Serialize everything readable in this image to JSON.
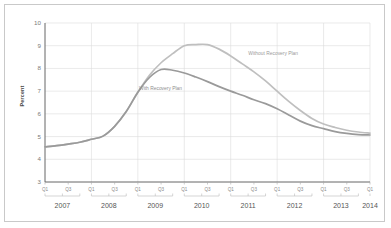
{
  "chart_data": {
    "type": "line",
    "title": "",
    "subtitle": "",
    "xlabel": "",
    "ylabel": "Percent",
    "ylim": [
      3,
      10
    ],
    "yticks": [
      3,
      4,
      5,
      6,
      7,
      8,
      9,
      10
    ],
    "grid": true,
    "legend_position": "inline-annotations",
    "x_tick_labels": [
      "Q1",
      "Q3"
    ],
    "x_groups": [
      {
        "year": "2007",
        "quarters": [
          "Q1",
          "Q3"
        ]
      },
      {
        "year": "2008",
        "quarters": [
          "Q1",
          "Q3"
        ]
      },
      {
        "year": "2009",
        "quarters": [
          "Q1",
          "Q3"
        ]
      },
      {
        "year": "2010",
        "quarters": [
          "Q1",
          "Q3"
        ]
      },
      {
        "year": "2011",
        "quarters": [
          "Q1",
          "Q3"
        ]
      },
      {
        "year": "2012",
        "quarters": [
          "Q1",
          "Q3"
        ]
      },
      {
        "year": "2013",
        "quarters": [
          "Q1",
          "Q3"
        ]
      },
      {
        "year": "2014",
        "quarters": [
          "Q1"
        ]
      }
    ],
    "x": [
      "2007Q1",
      "2007Q2",
      "2007Q3",
      "2007Q4",
      "2008Q1",
      "2008Q2",
      "2008Q3",
      "2008Q4",
      "2009Q1",
      "2009Q2",
      "2009Q3",
      "2009Q4",
      "2010Q1",
      "2010Q2",
      "2010Q3",
      "2010Q4",
      "2011Q1",
      "2011Q2",
      "2011Q3",
      "2011Q4",
      "2012Q1",
      "2012Q2",
      "2012Q3",
      "2012Q4",
      "2013Q1",
      "2013Q2",
      "2013Q3",
      "2013Q4",
      "2014Q1"
    ],
    "series": [
      {
        "name": "Without Recovery Plan",
        "color": "#bfbfbf",
        "values": [
          4.55,
          4.6,
          4.67,
          4.75,
          4.88,
          5.02,
          5.45,
          6.1,
          6.95,
          7.7,
          8.25,
          8.65,
          9.0,
          9.05,
          9.05,
          8.85,
          8.55,
          8.2,
          7.85,
          7.45,
          7.0,
          6.55,
          6.15,
          5.8,
          5.55,
          5.4,
          5.28,
          5.2,
          5.15
        ]
      },
      {
        "name": "With Recovery Plan",
        "color": "#9a9a9a",
        "values": [
          4.55,
          4.6,
          4.67,
          4.75,
          4.88,
          5.02,
          5.45,
          6.1,
          6.95,
          7.6,
          7.95,
          7.92,
          7.8,
          7.62,
          7.42,
          7.2,
          7.0,
          6.82,
          6.62,
          6.45,
          6.22,
          5.95,
          5.68,
          5.48,
          5.35,
          5.22,
          5.14,
          5.09,
          5.07
        ]
      }
    ],
    "annotations": [
      {
        "text": "Without Recovery Plan",
        "series": "Without Recovery Plan"
      },
      {
        "text": "With Recovery Plan",
        "series": "With Recovery Plan"
      }
    ]
  },
  "style": {
    "grid_color": "#dcdcdc",
    "axis_color": "#666666",
    "frame_color": "#c9c9c9",
    "background": "#ffffff",
    "tick_text_color": "#8a8a8a",
    "year_text_color": "#555555"
  }
}
